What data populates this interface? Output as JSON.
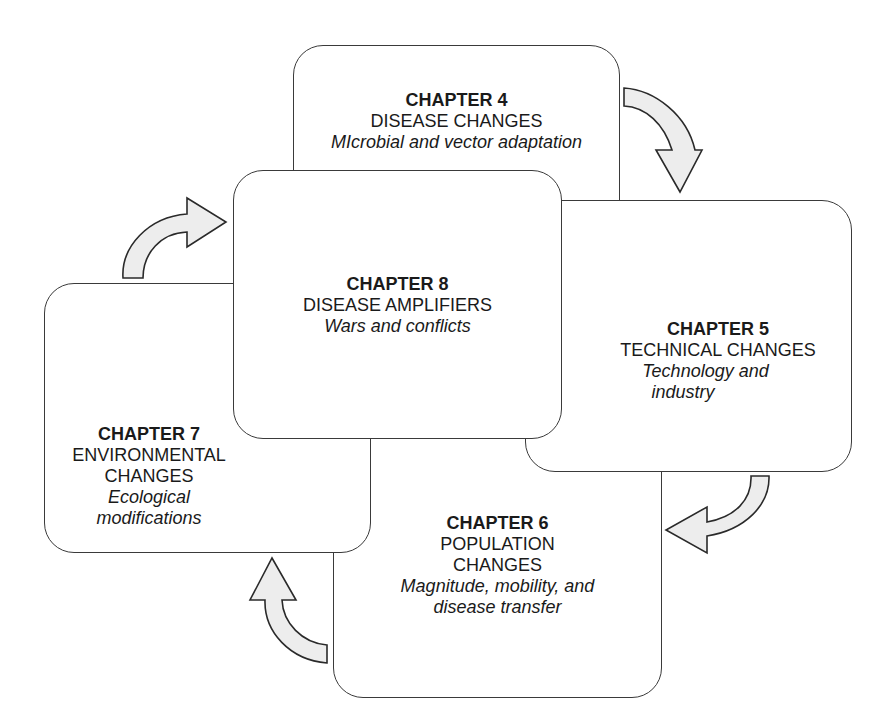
{
  "diagram": {
    "type": "cycle",
    "boxes": [
      {
        "id": "ch4",
        "chapter": "CHAPTER 4",
        "title": "DISEASE CHANGES",
        "subtitle": "MIcrobial and vector adaptation"
      },
      {
        "id": "ch5",
        "chapter": "CHAPTER 5",
        "title": "TECHNICAL CHANGES",
        "subtitle_line1": "Technology and",
        "subtitle_line2": "industry"
      },
      {
        "id": "ch6",
        "chapter": "CHAPTER 6",
        "title_line1": "POPULATION",
        "title_line2": "CHANGES",
        "subtitle_line1": "Magnitude, mobility, and",
        "subtitle_line2": "disease transfer"
      },
      {
        "id": "ch7",
        "chapter": "CHAPTER 7",
        "title_line1": "ENVIRONMENTAL",
        "title_line2": "CHANGES",
        "subtitle_line1": "Ecological",
        "subtitle_line2": "modifications"
      },
      {
        "id": "ch8",
        "chapter": "CHAPTER 8",
        "title": "DISEASE AMPLIFIERS",
        "subtitle": "Wars and conflicts"
      }
    ],
    "arrows": [
      {
        "from": "ch4",
        "to": "ch5"
      },
      {
        "from": "ch5",
        "to": "ch6"
      },
      {
        "from": "ch6",
        "to": "ch7"
      },
      {
        "from": "ch7",
        "to": "ch8"
      }
    ],
    "colors": {
      "border": "#3a3a3a",
      "arrow_fill": "#ededed",
      "background": "#ffffff"
    }
  }
}
